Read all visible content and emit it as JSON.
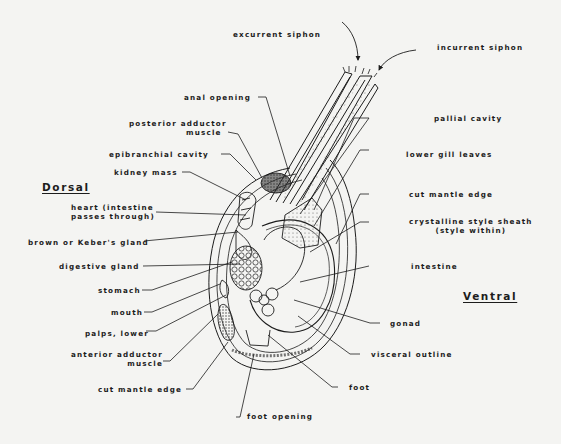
{
  "diagram": {
    "orientation": {
      "dorsal": "Dorsal",
      "ventral": "Ventral"
    },
    "labels": {
      "excurrent_siphon": "excurrent siphon",
      "incurrent_siphon": "incurrent siphon",
      "anal_opening": "anal opening",
      "posterior_adductor_1": "posterior adductor",
      "posterior_adductor_2": "muscle",
      "pallial_cavity": "pallial cavity",
      "epibranchial_cavity": "epibranchial cavity",
      "lower_gill_leaves": "lower gill leaves",
      "kidney_mass": "kidney mass",
      "cut_mantle_edge_right": "cut mantle edge",
      "heart_1": "heart (intestine",
      "heart_2": "passes through)",
      "crystalline_1": "crystalline style sheath",
      "crystalline_2": "(style within)",
      "brown_gland": "brown or Keber's gland",
      "digestive_gland": "digestive gland",
      "intestine": "intestine",
      "stomach": "stomach",
      "mouth": "mouth",
      "palps_lower": "palps, lower",
      "gonad": "gonad",
      "anterior_adductor_1": "anterior adductor",
      "anterior_adductor_2": "muscle",
      "visceral_outline": "visceral outline",
      "cut_mantle_edge_left": "cut mantle edge",
      "foot": "foot",
      "foot_opening": "foot opening"
    }
  },
  "colors": {
    "background": "#f4f4f2",
    "ink": "#1c1c1c",
    "stipple": "#555555"
  }
}
